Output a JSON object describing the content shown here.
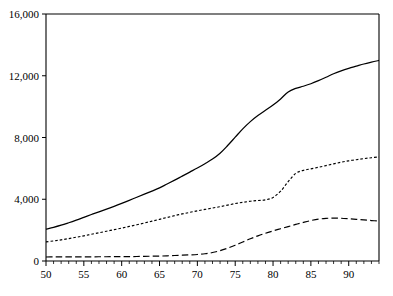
{
  "chart_data": {
    "type": "line",
    "title": "",
    "subtitle": "",
    "xlabel": "",
    "ylabel": "",
    "xlim": [
      50,
      94
    ],
    "ylim": [
      0,
      16000
    ],
    "grid": false,
    "legend": "none",
    "y_ticks": [
      0,
      4000,
      8000,
      12000,
      16000
    ],
    "y_tick_labels": [
      "0",
      "4,000",
      "8,000",
      "12,000",
      "16,000"
    ],
    "x_ticks": [
      50,
      55,
      60,
      65,
      70,
      75,
      80,
      85,
      90
    ],
    "x_tick_labels": [
      "50",
      "55",
      "60",
      "65",
      "70",
      "75",
      "80",
      "85",
      "90"
    ],
    "x_minor_tick_step": 1,
    "x": [
      50,
      51,
      52,
      53,
      54,
      55,
      56,
      57,
      58,
      59,
      60,
      61,
      62,
      63,
      64,
      65,
      66,
      67,
      68,
      69,
      70,
      71,
      72,
      73,
      74,
      75,
      76,
      77,
      78,
      79,
      80,
      81,
      82,
      83,
      84,
      85,
      86,
      87,
      88,
      89,
      90,
      91,
      92,
      93,
      94
    ],
    "series": [
      {
        "name": "series-1-solid",
        "style": "solid",
        "color": "#000000",
        "values": [
          2060,
          2180,
          2320,
          2480,
          2650,
          2830,
          3010,
          3180,
          3360,
          3540,
          3730,
          3930,
          4130,
          4330,
          4530,
          4740,
          4990,
          5240,
          5500,
          5760,
          6020,
          6300,
          6600,
          6980,
          7480,
          8020,
          8560,
          9030,
          9420,
          9760,
          10100,
          10500,
          10950,
          11180,
          11320,
          11480,
          11680,
          11900,
          12130,
          12320,
          12480,
          12620,
          12760,
          12880,
          12990
        ]
      },
      {
        "name": "series-2-dotted",
        "style": "dotted",
        "color": "#000000",
        "values": [
          1240,
          1300,
          1370,
          1450,
          1540,
          1630,
          1730,
          1830,
          1930,
          2030,
          2130,
          2240,
          2350,
          2460,
          2580,
          2700,
          2820,
          2940,
          3050,
          3150,
          3250,
          3340,
          3430,
          3520,
          3620,
          3720,
          3800,
          3870,
          3920,
          3960,
          4120,
          4520,
          5140,
          5680,
          5870,
          5970,
          6070,
          6180,
          6290,
          6400,
          6490,
          6560,
          6630,
          6690,
          6740
        ]
      },
      {
        "name": "series-3-dashed",
        "style": "dashed",
        "color": "#000000",
        "values": [
          260,
          262,
          264,
          266,
          268,
          270,
          272,
          274,
          276,
          278,
          280,
          285,
          292,
          300,
          310,
          320,
          335,
          355,
          375,
          395,
          420,
          470,
          550,
          670,
          830,
          1020,
          1230,
          1440,
          1630,
          1800,
          1950,
          2090,
          2230,
          2370,
          2500,
          2620,
          2710,
          2760,
          2780,
          2770,
          2740,
          2700,
          2660,
          2620,
          2590
        ]
      }
    ]
  }
}
